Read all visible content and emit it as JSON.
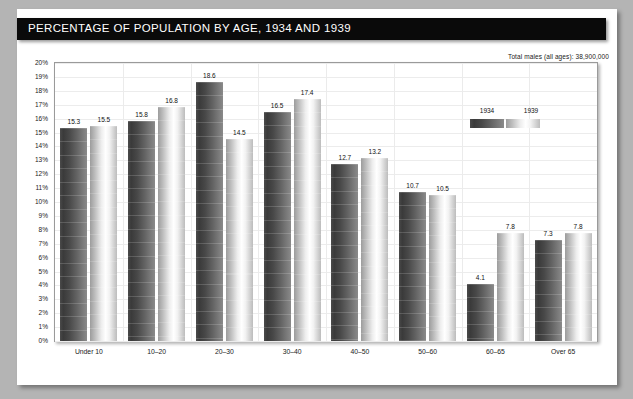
{
  "header": {
    "title": "PERCENTAGE OF POPULATION BY AGE, 1934 AND 1939"
  },
  "annotation": "Total males (all ages): 38,900,000",
  "legend": {
    "items": [
      {
        "label": "1934",
        "swatch": "dark-gradient-swatch"
      },
      {
        "label": "1939",
        "swatch": "light-gradient-swatch"
      }
    ]
  },
  "chart_data": {
    "type": "bar",
    "title": "PERCENTAGE OF POPULATION BY AGE, 1934 AND 1939",
    "subtitle": "Total males (all ages): 38,900,000",
    "xlabel": "",
    "ylabel": "",
    "ylim": [
      0,
      20
    ],
    "ytick_step": 1,
    "grid": true,
    "legend_position": "top-right-inside",
    "categories": [
      "Under 10",
      "10–20",
      "20–30",
      "30–40",
      "40–50",
      "50–60",
      "60–65",
      "Over 65"
    ],
    "ytick_labels": [
      "0%",
      "1%",
      "2%",
      "3%",
      "4%",
      "5%",
      "6%",
      "7%",
      "8%",
      "9%",
      "10%",
      "11%",
      "12%",
      "13%",
      "14%",
      "15%",
      "16%",
      "17%",
      "18%",
      "19%",
      "20%"
    ],
    "series": [
      {
        "name": "1934",
        "color": "#3f3f3f",
        "values": [
          15.3,
          15.8,
          18.6,
          16.5,
          12.7,
          10.7,
          4.1,
          7.3
        ]
      },
      {
        "name": "1939",
        "color": "#e6e6e6",
        "values": [
          15.5,
          16.8,
          14.5,
          17.4,
          13.2,
          10.5,
          7.8,
          7.8
        ]
      }
    ]
  }
}
